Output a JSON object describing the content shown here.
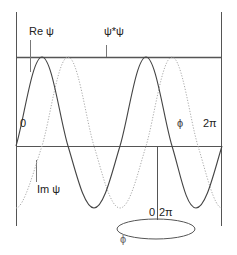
{
  "diagram": {
    "labels": {
      "re_psi": "Re ψ",
      "psi_star_psi": "ψ*ψ",
      "zero_axis": "0",
      "phi_axis": "ϕ",
      "two_pi_axis": "2π",
      "im_psi": "Im ψ",
      "ring_zero": "0",
      "ring_two_pi": "2π",
      "ring_phi": "ϕ"
    },
    "colors": {
      "solid_curve": "#444444",
      "dotted_curve": "#aaaaaa",
      "lines": "#555555",
      "background": "#ffffff"
    },
    "curves": [
      {
        "name": "Re ψ",
        "style": "solid",
        "cycles": 2,
        "phase_offset": 0
      },
      {
        "name": "Im ψ",
        "style": "dotted",
        "cycles": 2,
        "phase_offset": 0.25
      }
    ]
  }
}
